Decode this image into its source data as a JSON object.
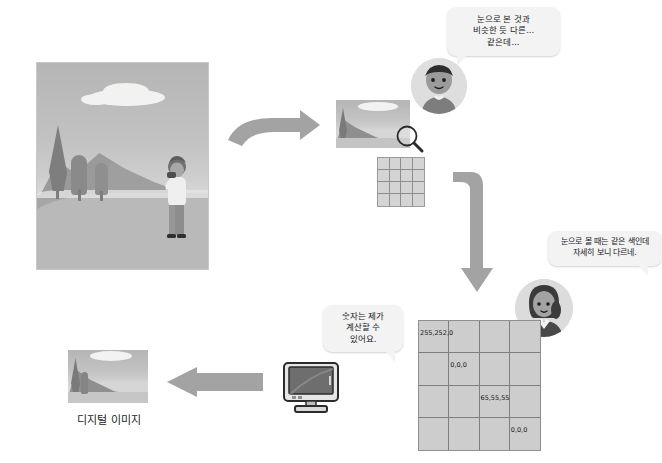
{
  "diagram": {
    "title_caption": "디지털 이미지",
    "speech_bubbles": [
      {
        "id": "man-bubble",
        "speaker": "man-avatar",
        "lines": [
          "눈으로 본 것과",
          "비슷한 듯 다른...",
          "같은데..."
        ],
        "text": "눈으로 본 것과 비슷한 듯 다른... 같은데..."
      },
      {
        "id": "woman-bubble",
        "speaker": "woman-avatar",
        "lines": [
          "눈으로 볼 때는 같은 색인데",
          "자세히 보니 다르네."
        ],
        "text": "눈으로 볼 때는 같은 색인데 자세히 보니 다르네."
      },
      {
        "id": "computer-bubble",
        "speaker": "computer-monitor",
        "lines": [
          "숫자는 제가",
          "계산할 수",
          "있어요."
        ],
        "text": "숫자는 제가 계산할 수 있어요."
      }
    ],
    "pixel_grid": {
      "rows": 4,
      "cols": 4,
      "labels": [
        {
          "row": 0,
          "col": 0,
          "value": "255,252,0"
        },
        {
          "row": 1,
          "col": 1,
          "value": "0,0,0"
        },
        {
          "row": 2,
          "col": 2,
          "value": "65,55,55"
        },
        {
          "row": 3,
          "col": 3,
          "value": "0,0,0"
        }
      ]
    },
    "thumbnail_grid": {
      "rows": 4,
      "cols": 4
    },
    "icons": {
      "magnifier": "magnifier-icon",
      "monitor": "monitor-icon",
      "arrow_right_1": "arrow-right-icon",
      "arrow_down": "arrow-down-icon",
      "arrow_left": "arrow-left-icon"
    },
    "colors": {
      "bubble_bg": "#f3f3f3",
      "arrow_fill": "#a3a3a3",
      "grid_bg": "#cdcdcd",
      "grid_line": "#7f7f7f",
      "text": "#1a1a1a",
      "photo_sky": "#bfbfbf",
      "photo_mountain": "#9a9a9a",
      "photo_road": "#bdbdbd"
    }
  }
}
